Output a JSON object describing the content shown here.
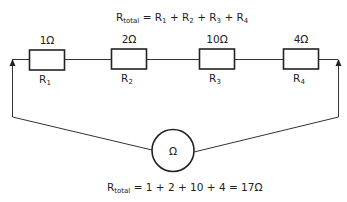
{
  "diagram": {
    "type": "series-resistor-circuit",
    "top_formula": {
      "lhs_main": "R",
      "lhs_sub": "total",
      "rhs": [
        {
          "main": "R",
          "sub": "1"
        },
        {
          "main": "R",
          "sub": "2"
        },
        {
          "main": "R",
          "sub": "3"
        },
        {
          "main": "R",
          "sub": "4"
        }
      ],
      "eq": " = ",
      "plus": " + "
    },
    "resistors": [
      {
        "id": "R1",
        "name_main": "R",
        "name_sub": "1",
        "value": "1Ω"
      },
      {
        "id": "R2",
        "name_main": "R",
        "name_sub": "2",
        "value": "2Ω"
      },
      {
        "id": "R3",
        "name_main": "R",
        "name_sub": "3",
        "value": "10Ω"
      },
      {
        "id": "R4",
        "name_main": "R",
        "name_sub": "4",
        "value": "4Ω"
      }
    ],
    "meter": {
      "symbol": "Ω",
      "type": "ohmmeter"
    },
    "bottom_formula": {
      "lhs_main": "R",
      "lhs_sub": "total",
      "rhs": " = 1 + 2 + 10 + 4 = 17Ω"
    },
    "colors": {
      "line": "#333333",
      "text": "#222222",
      "background": "#ffffff"
    }
  }
}
